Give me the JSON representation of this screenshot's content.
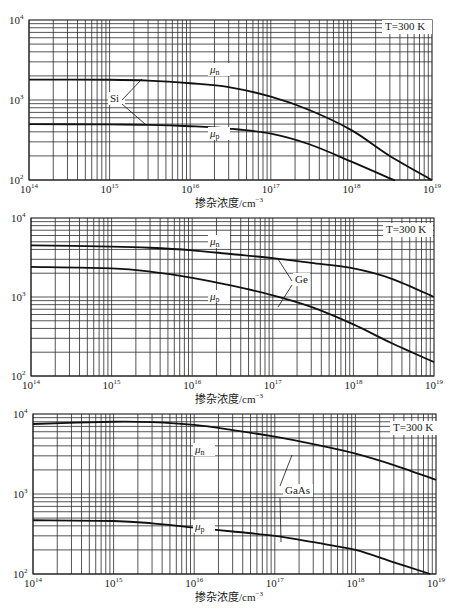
{
  "chart_data": [
    {
      "type": "line",
      "title": "Si",
      "material": "Si",
      "annotation": "T=300 K",
      "xscale": "log",
      "yscale": "log",
      "xlabel": "掺杂浓度/cm⁻³",
      "ylabel": "",
      "xlim": [
        100000000000000.0,
        1e+19
      ],
      "ylim": [
        100,
        10000
      ],
      "x_ticks": [
        "10^14",
        "10^15",
        "10^16",
        "10^17",
        "10^18",
        "10^19"
      ],
      "y_ticks": [
        "10^2",
        "10^3",
        "10^4"
      ],
      "grid": true,
      "x": [
        100000000000000.0,
        1000000000000000.0,
        3000000000000000.0,
        1e+16,
        3e+16,
        1e+17,
        3e+17,
        1e+18,
        3e+18,
        1e+19
      ],
      "series": [
        {
          "name": "μn",
          "values": [
            1800,
            1790,
            1750,
            1620,
            1450,
            1100,
            750,
            420,
            200,
            100
          ]
        },
        {
          "name": "μp",
          "values": [
            500,
            495,
            490,
            470,
            440,
            380,
            280,
            170,
            105,
            null
          ]
        }
      ]
    },
    {
      "type": "line",
      "title": "Ge",
      "material": "Ge",
      "annotation": "T=300 K",
      "xscale": "log",
      "yscale": "log",
      "xlabel": "掺杂浓度/cm⁻³",
      "ylabel": "",
      "xlim": [
        100000000000000.0,
        1e+19
      ],
      "ylim": [
        100,
        10000
      ],
      "x_ticks": [
        "10^14",
        "10^15",
        "10^16",
        "10^17",
        "10^18",
        "10^19"
      ],
      "y_ticks": [
        "10^2",
        "10^3",
        "10^4"
      ],
      "grid": true,
      "x": [
        100000000000000.0,
        1000000000000000.0,
        3000000000000000.0,
        1e+16,
        3e+16,
        1e+17,
        3e+17,
        1e+18,
        3e+18,
        1e+19
      ],
      "series": [
        {
          "name": "μn",
          "values": [
            4500,
            4350,
            4200,
            3900,
            3500,
            3100,
            2700,
            2300,
            1700,
            1000
          ]
        },
        {
          "name": "μp",
          "values": [
            2400,
            2300,
            2100,
            1750,
            1400,
            1050,
            750,
            450,
            260,
            150
          ]
        }
      ]
    },
    {
      "type": "line",
      "title": "GaAs",
      "material": "GaAs",
      "annotation": "T=300 K",
      "xscale": "log",
      "yscale": "log",
      "xlabel": "掺杂浓度/cm⁻³",
      "ylabel": "",
      "xlim": [
        100000000000000.0,
        1e+19
      ],
      "ylim": [
        100,
        10000
      ],
      "x_ticks": [
        "10^14",
        "10^15",
        "10^16",
        "10^17",
        "10^18",
        "10^19"
      ],
      "y_ticks": [
        "10^2",
        "10^3",
        "10^4"
      ],
      "grid": true,
      "x": [
        100000000000000.0,
        1000000000000000.0,
        3000000000000000.0,
        1e+16,
        3e+16,
        1e+17,
        3e+17,
        1e+18,
        3e+18,
        1e+19
      ],
      "series": [
        {
          "name": "μn",
          "values": [
            7500,
            8000,
            7900,
            7300,
            6300,
            5200,
            4200,
            3200,
            2300,
            1500
          ]
        },
        {
          "name": "μp",
          "values": [
            470,
            460,
            430,
            380,
            340,
            300,
            250,
            200,
            140,
            null
          ]
        }
      ]
    }
  ],
  "charts": [
    {
      "top": 20,
      "left": 29,
      "right": 432,
      "bottom": 180,
      "label_mu_n_pos": [
        210,
        73
      ],
      "label_mu_p_pos": [
        210,
        137
      ],
      "material_label_pos": [
        110,
        102
      ],
      "material_leader": [
        [
          122,
          100,
          142,
          79
        ],
        [
          122,
          104,
          145,
          124
        ]
      ],
      "annotation_pos": [
        385,
        30
      ]
    },
    {
      "top": 218,
      "left": 31,
      "right": 434,
      "bottom": 376,
      "label_mu_n_pos": [
        210,
        245
      ],
      "label_mu_p_pos": [
        210,
        300
      ],
      "material_label_pos": [
        295,
        283
      ],
      "material_leader": [
        [
          292,
          281,
          278,
          259
        ],
        [
          292,
          285,
          278,
          307
        ]
      ],
      "annotation_pos": [
        386,
        233
      ]
    },
    {
      "top": 414,
      "left": 33,
      "right": 436,
      "bottom": 574,
      "label_mu_n_pos": [
        195,
        453
      ],
      "label_mu_p_pos": [
        195,
        530
      ],
      "material_label_pos": [
        285,
        494
      ],
      "material_leader": [
        [
          280,
          486,
          292,
          455
        ],
        [
          280,
          498,
          281,
          542
        ]
      ],
      "annotation_pos": [
        393,
        431
      ]
    }
  ],
  "labels": {
    "mu_n": "μn",
    "mu_p": "μp",
    "temperature": "T=300 K",
    "xlabel_text": "掺杂浓度/cm",
    "xlabel_exp": "−3",
    "x_tick_base": "10",
    "x_tick_exps": [
      "14",
      "15",
      "16",
      "17",
      "18",
      "19"
    ],
    "y_tick_exps": [
      "4",
      "3",
      "2"
    ]
  }
}
